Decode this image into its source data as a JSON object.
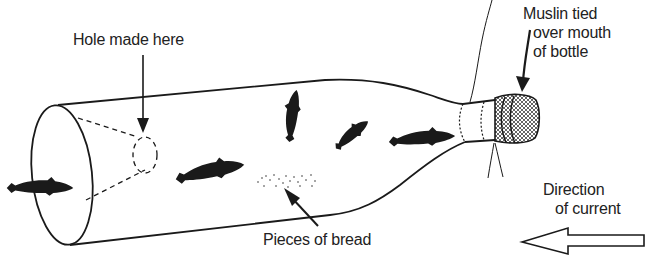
{
  "diagram": {
    "labels": {
      "hole": "Hole made here",
      "muslin": {
        "line1": "Muslin tied",
        "line2": "over mouth",
        "line3": "of bottle"
      },
      "bread": "Pieces of bread",
      "current": {
        "line1": "Direction",
        "line2": "of current"
      }
    },
    "elements": [
      {
        "name": "bottle",
        "description": "Glass bottle lying on its side, base end open"
      },
      {
        "name": "open-base",
        "description": "Ellipse at left where bottom of bottle is removed"
      },
      {
        "name": "hole-cone",
        "description": "Dashed funnel leading to hole inside bottle"
      },
      {
        "name": "muslin-cap",
        "description": "Cross-hatched muslin tied over bottle mouth"
      },
      {
        "name": "string",
        "description": "Strings tied at bottle neck"
      },
      {
        "name": "bread",
        "description": "Crumbs of bread inside bottle"
      },
      {
        "name": "current-arrow",
        "description": "Hollow arrow pointing left"
      }
    ],
    "fish_count": 6,
    "colors": {
      "ink": "#1a1a1a",
      "background": "#ffffff"
    }
  }
}
